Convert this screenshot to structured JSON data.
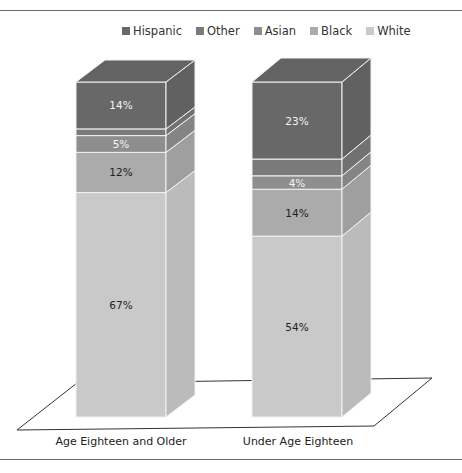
{
  "chart_data": {
    "type": "bar",
    "stacked": true,
    "three_d": true,
    "title": "",
    "xlabel": "",
    "ylabel": "",
    "categories": [
      "Age Eighteen and Older",
      "Under Age Eighteen"
    ],
    "series": [
      {
        "name": "White",
        "values": [
          67,
          54
        ],
        "color": "#c9c9c9",
        "labels": [
          "67%",
          "54%"
        ]
      },
      {
        "name": "Black",
        "values": [
          12,
          14
        ],
        "color": "#ababab",
        "labels": [
          "12%",
          "14%"
        ]
      },
      {
        "name": "Asian",
        "values": [
          5,
          4
        ],
        "color": "#8e8e8e",
        "labels": [
          "5%",
          "4%"
        ]
      },
      {
        "name": "Other",
        "values": [
          2,
          5
        ],
        "color": "#7a7a7a",
        "labels": [
          "",
          ""
        ]
      },
      {
        "name": "Hispanic",
        "values": [
          14,
          23
        ],
        "color": "#686868",
        "labels": [
          "14%",
          "23%"
        ]
      }
    ],
    "legend": [
      "Hispanic",
      "Other",
      "Asian",
      "Black",
      "White"
    ],
    "legend_position": "top",
    "grid": false
  },
  "legend": {
    "items": [
      {
        "name": "Hispanic",
        "color": "#686868"
      },
      {
        "name": "Other",
        "color": "#7a7a7a"
      },
      {
        "name": "Asian",
        "color": "#8e8e8e"
      },
      {
        "name": "Black",
        "color": "#ababab"
      },
      {
        "name": "White",
        "color": "#c9c9c9"
      }
    ]
  },
  "axis": {
    "categories": [
      "Age Eighteen and Older",
      "Under Age Eighteen"
    ]
  }
}
